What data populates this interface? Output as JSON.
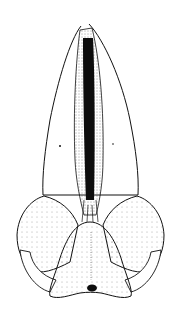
{
  "figure": {
    "style": "pen-and-ink stipple illustration",
    "background": "#ffffff",
    "ink": "#111111"
  }
}
